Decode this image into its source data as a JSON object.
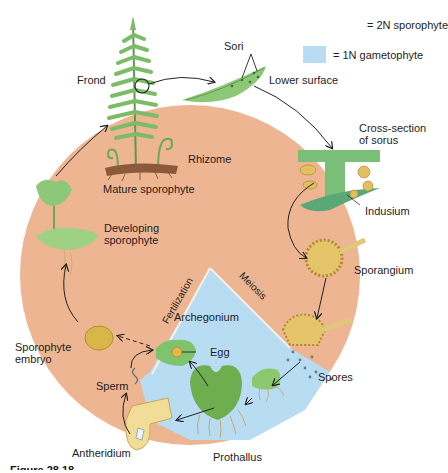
{
  "legend": {
    "items": [
      {
        "swatch": "none",
        "label": "= 2N sporophyte"
      },
      {
        "swatch_color": "#b8dcf2",
        "label": "= 1N gametophyte"
      }
    ]
  },
  "colors": {
    "sporophyte_region": "#eeb592",
    "gametophyte_region": "#b8dcf2",
    "plant_green": "#6fae5a",
    "sporangium_yellow": "#e0c060",
    "arrow": "#222222"
  },
  "labels": {
    "frond": "Frond",
    "sori": "Sori",
    "lower_surface": "Lower surface",
    "cross_section_line1": "Cross-section",
    "cross_section_line2": "of sorus",
    "rhizome": "Rhizome",
    "mature_sporophyte": "Mature sporophyte",
    "indusium": "Indusium",
    "developing_line1": "Developing",
    "developing_line2": "sporophyte",
    "sporangium": "Sporangium",
    "meiosis": "Meiosis",
    "fertilization": "Fertilization",
    "archegonium": "Archegonium",
    "egg": "Egg",
    "embryo_line1": "Sporophyte",
    "embryo_line2": "embryo",
    "spores": "Spores",
    "sperm": "Sperm",
    "antheridium": "Antheridium",
    "prothallus": "Prothallus"
  },
  "caption": "Figure 28.18"
}
